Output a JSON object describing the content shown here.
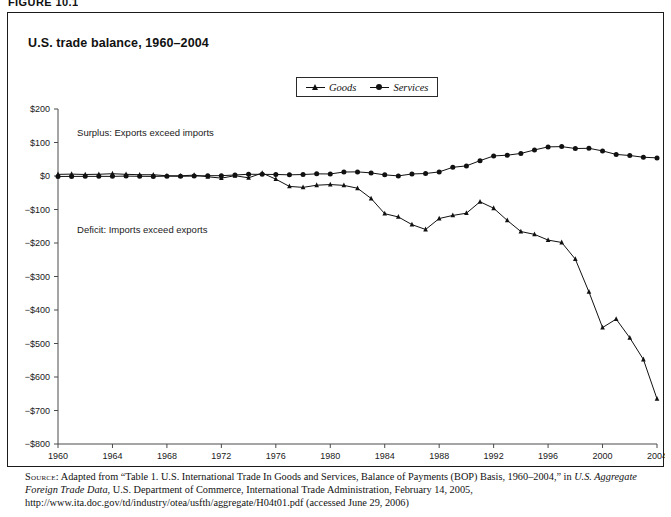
{
  "figure": {
    "label": "FIGURE 10.1",
    "title": "U.S. trade balance, 1960–2004"
  },
  "legend": {
    "position": "top-center",
    "items": [
      {
        "label": "Goods",
        "marker": "triangle-marker-icon"
      },
      {
        "label": "Services",
        "marker": "circle-marker-icon"
      }
    ]
  },
  "annotations": {
    "surplus": "Surplus: Exports exceed imports",
    "deficit": "Deficit: Imports exceed exports"
  },
  "source": {
    "keyword": "Source:",
    "part1": " Adapted from “Table 1. U.S. International Trade In Goods and Services, Balance of Payments (BOP) Basis, 1960–2004,” in ",
    "italic1": "U.S. Aggregate Foreign Trade Data",
    "part2": ", U.S. Department of Commerce, International Trade Administration, February 14, 2005, http://www.ita.doc.gov/td/industry/otea/usfth/aggregate/H04t01.pdf (accessed June 29, 2006)"
  },
  "chart_data": {
    "type": "line",
    "title": "U.S. trade balance, 1960–2004",
    "xlabel": "",
    "ylabel": "",
    "xlim": [
      1960,
      2004
    ],
    "ylim": [
      -800,
      200
    ],
    "grid": false,
    "legend_position": "top-center",
    "xticks": [
      1960,
      1964,
      1968,
      1972,
      1976,
      1980,
      1984,
      1988,
      1992,
      1996,
      2000,
      2004
    ],
    "xticklabels": [
      "1960",
      "1964",
      "1968",
      "1972",
      "1976",
      "1980",
      "1984",
      "1988",
      "1992",
      "1996",
      "2000",
      "2004"
    ],
    "yticks": [
      200,
      100,
      0,
      -100,
      -200,
      -300,
      -400,
      -500,
      -600,
      -700,
      -800
    ],
    "yticklabels": [
      "$200",
      "$100",
      "$0",
      "−$100",
      "−$200",
      "−$300",
      "−$400",
      "−$500",
      "−$600",
      "−$700",
      "−$800"
    ],
    "unit": "billions of U.S. dollars",
    "x": [
      1960,
      1961,
      1962,
      1963,
      1964,
      1965,
      1966,
      1967,
      1968,
      1969,
      1970,
      1971,
      1972,
      1973,
      1974,
      1975,
      1976,
      1977,
      1978,
      1979,
      1980,
      1981,
      1982,
      1983,
      1984,
      1985,
      1986,
      1987,
      1988,
      1989,
      1990,
      1991,
      1992,
      1993,
      1994,
      1995,
      1996,
      1997,
      1998,
      1999,
      2000,
      2001,
      2002,
      2003,
      2004
    ],
    "series": [
      {
        "name": "Goods",
        "marker": "triangle",
        "values": [
          4.9,
          5.6,
          4.5,
          5.2,
          6.8,
          5.0,
          3.8,
          3.8,
          0.6,
          0.6,
          2.6,
          -2.3,
          -6.4,
          0.9,
          -5.5,
          8.9,
          -9.5,
          -31.1,
          -34.0,
          -27.5,
          -25.5,
          -28.0,
          -36.5,
          -67.1,
          -112.5,
          -122.2,
          -145.1,
          -159.6,
          -127.0,
          -117.7,
          -111.0,
          -76.9,
          -96.1,
          -132.6,
          -165.8,
          -174.2,
          -191.3,
          -198.4,
          -248.2,
          -346.0,
          -452.4,
          -427.2,
          -482.9,
          -547.6,
          -665.4
        ]
      },
      {
        "name": "Services",
        "marker": "circle",
        "values": [
          -1.4,
          -1.2,
          -1.1,
          -1.1,
          -1.1,
          -0.3,
          -0.9,
          -1.2,
          -0.4,
          -0.8,
          -0.3,
          0.9,
          1.0,
          3.0,
          5.2,
          4.9,
          4.6,
          3.5,
          4.4,
          6.4,
          6.1,
          11.9,
          12.3,
          9.3,
          3.4,
          0.3,
          6.1,
          7.4,
          12.2,
          26.0,
          30.2,
          45.8,
          59.9,
          62.1,
          67.3,
          77.8,
          86.9,
          87.7,
          82.1,
          82.7,
          74.9,
          64.4,
          61.2,
          56.0,
          54.1
        ]
      }
    ]
  }
}
